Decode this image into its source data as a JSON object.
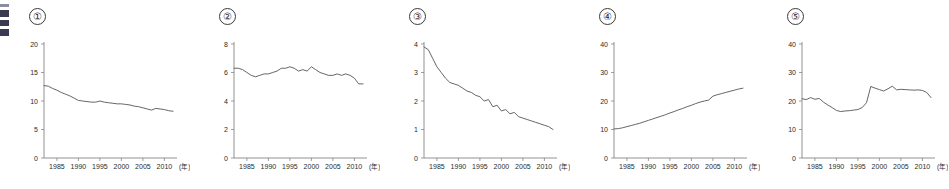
{
  "page": {
    "background": "#ffffff",
    "line_color": "#555555",
    "axis_color": "#777777",
    "text_color": "#2b2b2b"
  },
  "edge_fragment": {
    "name": "cropped-left-margin-graphic"
  },
  "panel_labels": [
    "①",
    "②",
    "③",
    "④",
    "⑤"
  ],
  "x_unit_label": "(年)",
  "x_tick_labels": [
    "1985",
    "1990",
    "1995",
    "2000",
    "2005",
    "2010"
  ],
  "x_tick_values": [
    1985,
    1990,
    1995,
    2000,
    2005,
    2010
  ],
  "chart_data": [
    {
      "type": "line",
      "id": "chart-1",
      "title": "①",
      "xlabel": "(年)",
      "ylabel": "",
      "xlim": [
        1982,
        2012
      ],
      "ylim": [
        0,
        20
      ],
      "yticks": [
        0,
        5,
        10,
        15,
        20
      ],
      "ytick_labels": [
        "0",
        "5",
        "10",
        "15",
        "20"
      ],
      "xticks": [
        1985,
        1990,
        1995,
        2000,
        2005,
        2010
      ],
      "xtick_labels": [
        "1985",
        "1990",
        "1995",
        "2000",
        "2005",
        "2010"
      ],
      "grid": false,
      "legend": "none",
      "x": [
        1982,
        1983,
        1984,
        1985,
        1986,
        1987,
        1988,
        1989,
        1990,
        1991,
        1992,
        1993,
        1994,
        1995,
        1996,
        1997,
        1998,
        1999,
        2000,
        2001,
        2002,
        2003,
        2004,
        2005,
        2006,
        2007,
        2008,
        2009,
        2010,
        2011,
        2012
      ],
      "values": [
        12.7,
        12.6,
        12.2,
        11.9,
        11.5,
        11.2,
        10.9,
        10.5,
        10.1,
        10.0,
        9.9,
        9.8,
        9.8,
        10.0,
        9.8,
        9.7,
        9.6,
        9.5,
        9.5,
        9.4,
        9.3,
        9.1,
        9.0,
        8.8,
        8.6,
        8.4,
        8.7,
        8.6,
        8.5,
        8.3,
        8.2
      ]
    },
    {
      "type": "line",
      "id": "chart-2",
      "title": "②",
      "xlabel": "(年)",
      "ylabel": "",
      "xlim": [
        1982,
        2012
      ],
      "ylim": [
        0,
        8
      ],
      "yticks": [
        0,
        2,
        4,
        6,
        8
      ],
      "ytick_labels": [
        "0",
        "2",
        "4",
        "6",
        "8"
      ],
      "xticks": [
        1985,
        1990,
        1995,
        2000,
        2005,
        2010
      ],
      "xtick_labels": [
        "1985",
        "1990",
        "1995",
        "2000",
        "2005",
        "2010"
      ],
      "grid": false,
      "legend": "none",
      "x": [
        1982,
        1983,
        1984,
        1985,
        1986,
        1987,
        1988,
        1989,
        1990,
        1991,
        1992,
        1993,
        1994,
        1995,
        1996,
        1997,
        1998,
        1999,
        2000,
        2001,
        2002,
        2003,
        2004,
        2005,
        2006,
        2007,
        2008,
        2009,
        2010,
        2011,
        2012
      ],
      "values": [
        6.3,
        6.3,
        6.2,
        6.0,
        5.8,
        5.7,
        5.8,
        5.9,
        5.9,
        6.0,
        6.1,
        6.3,
        6.3,
        6.4,
        6.3,
        6.1,
        6.2,
        6.1,
        6.4,
        6.2,
        6.0,
        5.9,
        5.8,
        5.8,
        5.9,
        5.8,
        5.9,
        5.8,
        5.6,
        5.2,
        5.2
      ]
    },
    {
      "type": "line",
      "id": "chart-3",
      "title": "③",
      "xlabel": "(年)",
      "ylabel": "",
      "xlim": [
        1982,
        2012
      ],
      "ylim": [
        0,
        4
      ],
      "yticks": [
        0,
        1,
        2,
        3,
        4
      ],
      "ytick_labels": [
        "0",
        "1",
        "2",
        "3",
        "4"
      ],
      "xticks": [
        1985,
        1990,
        1995,
        2000,
        2005,
        2010
      ],
      "xtick_labels": [
        "1985",
        "1990",
        "1995",
        "2000",
        "2005",
        "2010"
      ],
      "grid": false,
      "legend": "none",
      "x": [
        1982,
        1983,
        1984,
        1985,
        1986,
        1987,
        1988,
        1989,
        1990,
        1991,
        1992,
        1993,
        1994,
        1995,
        1996,
        1997,
        1998,
        1999,
        2000,
        2001,
        2002,
        2003,
        2004,
        2005,
        2006,
        2007,
        2008,
        2009,
        2010,
        2011,
        2012
      ],
      "values": [
        3.9,
        3.8,
        3.5,
        3.2,
        3.0,
        2.8,
        2.65,
        2.6,
        2.55,
        2.45,
        2.35,
        2.3,
        2.2,
        2.15,
        2.0,
        2.05,
        1.8,
        1.85,
        1.65,
        1.7,
        1.55,
        1.6,
        1.45,
        1.4,
        1.35,
        1.3,
        1.25,
        1.2,
        1.15,
        1.1,
        1.0
      ]
    },
    {
      "type": "line",
      "id": "chart-4",
      "title": "④",
      "xlabel": "(年)",
      "ylabel": "",
      "xlim": [
        1982,
        2012
      ],
      "ylim": [
        0,
        40
      ],
      "yticks": [
        0,
        10,
        20,
        30,
        40
      ],
      "ytick_labels": [
        "0",
        "10",
        "20",
        "30",
        "40"
      ],
      "xticks": [
        1985,
        1990,
        1995,
        2000,
        2005,
        2010
      ],
      "xtick_labels": [
        "1985",
        "1990",
        "1995",
        "2000",
        "2005",
        "2010"
      ],
      "grid": false,
      "legend": "none",
      "x": [
        1982,
        1983,
        1984,
        1985,
        1986,
        1987,
        1988,
        1989,
        1990,
        1991,
        1992,
        1993,
        1994,
        1995,
        1996,
        1997,
        1998,
        1999,
        2000,
        2001,
        2002,
        2003,
        2004,
        2005,
        2006,
        2007,
        2008,
        2009,
        2010,
        2011,
        2012
      ],
      "values": [
        10.2,
        10.3,
        10.6,
        11.0,
        11.4,
        11.8,
        12.2,
        12.7,
        13.2,
        13.7,
        14.2,
        14.7,
        15.2,
        15.8,
        16.3,
        16.9,
        17.4,
        18.0,
        18.5,
        19.1,
        19.6,
        20.0,
        20.3,
        21.7,
        22.2,
        22.6,
        23.0,
        23.4,
        23.8,
        24.2,
        24.5
      ]
    },
    {
      "type": "line",
      "id": "chart-5",
      "title": "⑤",
      "xlabel": "(年)",
      "ylabel": "",
      "xlim": [
        1982,
        2012
      ],
      "ylim": [
        0,
        40
      ],
      "yticks": [
        0,
        10,
        20,
        30,
        40
      ],
      "ytick_labels": [
        "0",
        "10",
        "20",
        "30",
        "40"
      ],
      "xticks": [
        1985,
        1990,
        1995,
        2000,
        2005,
        2010
      ],
      "xtick_labels": [
        "1985",
        "1990",
        "1995",
        "2000",
        "2005",
        "2010"
      ],
      "grid": false,
      "legend": "none",
      "x": [
        1982,
        1983,
        1984,
        1985,
        1986,
        1987,
        1988,
        1989,
        1990,
        1991,
        1992,
        1993,
        1994,
        1995,
        1996,
        1997,
        1998,
        1999,
        2000,
        2001,
        2002,
        2003,
        2004,
        2005,
        2006,
        2007,
        2008,
        2009,
        2010,
        2011,
        2012
      ],
      "values": [
        20.8,
        20.5,
        21.2,
        20.6,
        20.9,
        19.6,
        18.6,
        17.7,
        16.7,
        16.3,
        16.5,
        16.6,
        16.8,
        17.0,
        17.7,
        19.4,
        25.1,
        24.5,
        24.0,
        23.5,
        24.3,
        25.2,
        23.9,
        24.1,
        24.0,
        23.9,
        23.8,
        23.9,
        23.7,
        23.0,
        21.2
      ]
    }
  ]
}
